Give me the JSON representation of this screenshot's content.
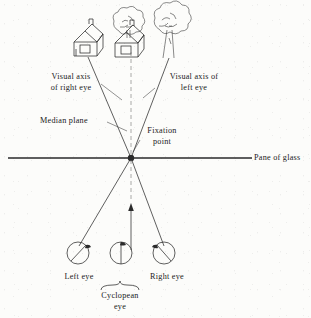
{
  "figure": {
    "background_color": "#fcfcfa",
    "ink_color": "#2b2b2b",
    "width": 311,
    "height": 318
  },
  "labels": {
    "visual_axis_right_line1": "Visual axis",
    "visual_axis_right_line2": "of right eye",
    "visual_axis_left_line1": "Visual axis of",
    "visual_axis_left_line2": "left eye",
    "median_plane": "Median plane",
    "fixation_point_line1": "Fixation",
    "fixation_point_line2": "point",
    "pane_of_glass": "Pane of glass",
    "left_eye": "Left eye",
    "right_eye": "Right eye",
    "cyclopean_line1": "Cyclopean",
    "cyclopean_line2": "eye"
  },
  "scene_objects": [
    {
      "name": "house-left",
      "type": "house",
      "x": 86,
      "y": 38
    },
    {
      "name": "house-center",
      "type": "house-with-tree",
      "x": 127,
      "y": 36
    },
    {
      "name": "tree-right",
      "type": "tree",
      "x": 168,
      "y": 33
    }
  ],
  "geometry": {
    "fixation_point": {
      "x": 131,
      "y": 158
    },
    "pane_line_y": 158,
    "pane_line_x_start": 8,
    "pane_line_x_end": 238,
    "left_eye": {
      "x": 78,
      "y": 253,
      "r": 11
    },
    "cyclopean_eye": {
      "x": 131,
      "y": 253,
      "r": 11
    },
    "right_eye": {
      "x": 164,
      "y": 253,
      "r": 11
    },
    "median_plane_dashed_top": {
      "x": 131,
      "y": 52
    },
    "arrow_tip": {
      "x": 131,
      "y": 205
    }
  }
}
